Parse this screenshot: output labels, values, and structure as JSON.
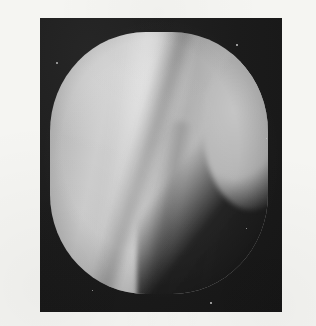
{
  "page": {
    "background_color": "#f5f5f2",
    "width": 316,
    "height": 326
  },
  "caption": {
    "text": "At the termination of the cutaneous",
    "note": "clipped at top edge of page"
  },
  "figure": {
    "kind": "photographic-plate",
    "panel": {
      "background_color": "#1d1d1d",
      "left": 40,
      "top": 18,
      "width": 242,
      "height": 294
    },
    "specimen": {
      "shape": "squircle",
      "base_color": "#b9b9b9",
      "highlight_color": "#d2d2d2",
      "shadow_color": "#262626"
    },
    "features": [
      {
        "name": "ridge-highlight",
        "description": "bright vertical ridge left of centre"
      },
      {
        "name": "diagonal-crease",
        "description": "dark diagonal crease from upper left to lower right"
      },
      {
        "name": "secondary-fold",
        "description": "soft secondary fold toward the bottom centre"
      },
      {
        "name": "dark-wedge",
        "description": "dark wedge-shaped shadow cutting the lower right quadrant"
      },
      {
        "name": "right-lobe",
        "description": "pale lobe remaining at the far right"
      }
    ],
    "specks": [
      {
        "x": 16,
        "y": 44,
        "size": 2.0
      },
      {
        "x": 196,
        "y": 26,
        "size": 1.6
      },
      {
        "x": 206,
        "y": 210,
        "size": 1.4
      },
      {
        "x": 226,
        "y": 120,
        "size": 1.3
      },
      {
        "x": 52,
        "y": 272,
        "size": 1.4
      },
      {
        "x": 170,
        "y": 284,
        "size": 1.5
      }
    ]
  }
}
